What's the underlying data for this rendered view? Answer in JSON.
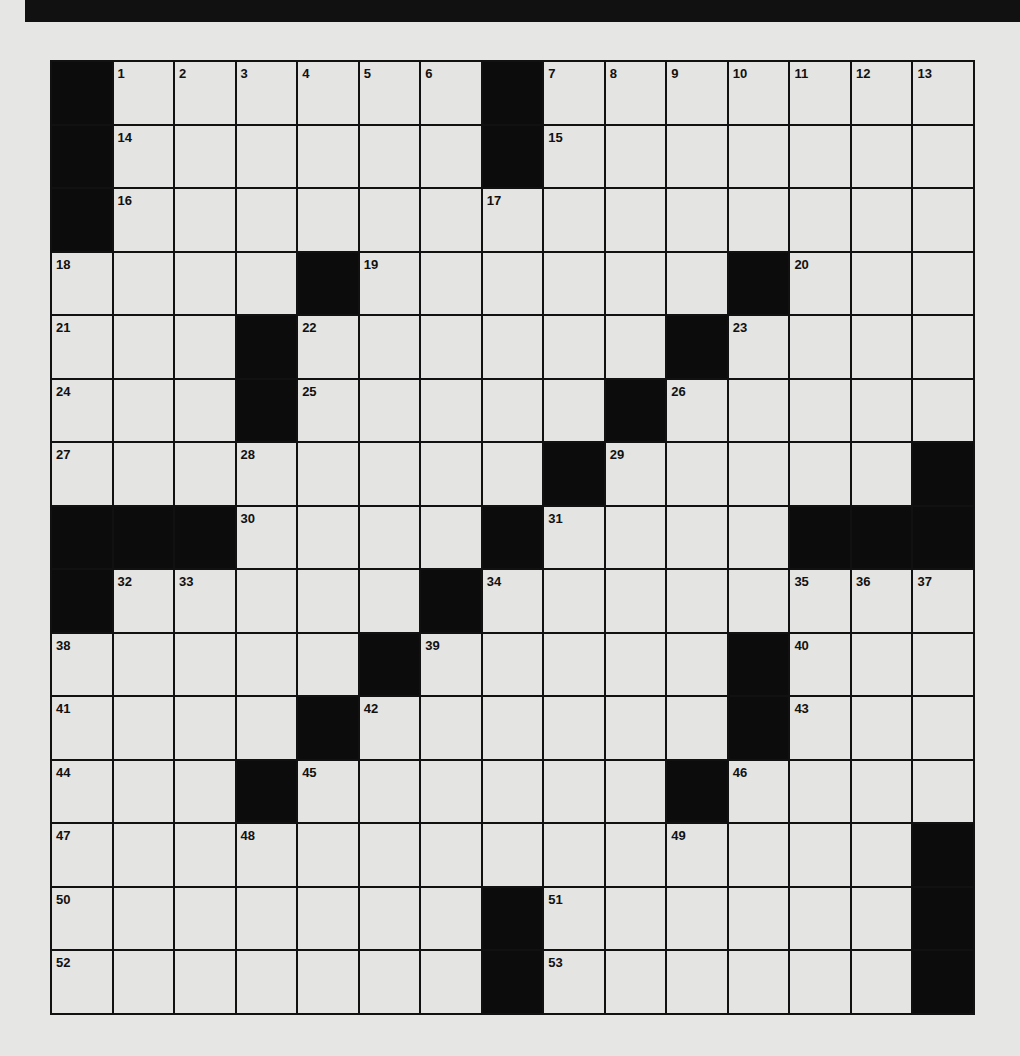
{
  "puzzle": {
    "rows": 15,
    "cols": 15,
    "colors": {
      "black": "#0c0c0c",
      "white": "#e4e4e2",
      "line": "#111111"
    },
    "grid": [
      [
        "#",
        "1",
        "2",
        "3",
        "4",
        "5",
        "6",
        "#",
        "7",
        "8",
        "9",
        "10",
        "11",
        "12",
        "13"
      ],
      [
        "#",
        "14",
        ".",
        ".",
        ".",
        ".",
        ".",
        "#",
        "15",
        ".",
        ".",
        ".",
        ".",
        ".",
        "."
      ],
      [
        "#",
        "16",
        ".",
        ".",
        ".",
        ".",
        ".",
        "17",
        ".",
        ".",
        ".",
        ".",
        ".",
        ".",
        "."
      ],
      [
        "18",
        ".",
        ".",
        ".",
        "#",
        "19",
        ".",
        ".",
        ".",
        ".",
        ".",
        "#",
        "20",
        ".",
        "."
      ],
      [
        "21",
        ".",
        ".",
        "#",
        "22",
        ".",
        ".",
        ".",
        ".",
        ".",
        "#",
        "23",
        ".",
        ".",
        "."
      ],
      [
        "24",
        ".",
        ".",
        "#",
        "25",
        ".",
        ".",
        ".",
        ".",
        "#",
        "26",
        ".",
        ".",
        ".",
        "."
      ],
      [
        "27",
        ".",
        ".",
        "28",
        ".",
        ".",
        ".",
        ".",
        "#",
        "29",
        ".",
        ".",
        ".",
        ".",
        "#"
      ],
      [
        "#",
        "#",
        "#",
        "30",
        ".",
        ".",
        ".",
        "#",
        "31",
        ".",
        ".",
        ".",
        "#",
        "#",
        "#"
      ],
      [
        "#",
        "32",
        "33",
        ".",
        ".",
        ".",
        "#",
        "34",
        ".",
        ".",
        ".",
        ".",
        "35",
        "36",
        "37"
      ],
      [
        "38",
        ".",
        ".",
        ".",
        ".",
        "#",
        "39",
        ".",
        ".",
        ".",
        ".",
        "#",
        "40",
        ".",
        "."
      ],
      [
        "41",
        ".",
        ".",
        ".",
        "#",
        "42",
        ".",
        ".",
        ".",
        ".",
        ".",
        "#",
        "43",
        ".",
        "."
      ],
      [
        "44",
        ".",
        ".",
        "#",
        "45",
        ".",
        ".",
        ".",
        ".",
        ".",
        "#",
        "46",
        ".",
        ".",
        "."
      ],
      [
        "47",
        ".",
        ".",
        "48",
        ".",
        ".",
        ".",
        ".",
        ".",
        ".",
        "49",
        ".",
        ".",
        ".",
        "#"
      ],
      [
        "50",
        ".",
        ".",
        ".",
        ".",
        ".",
        ".",
        "#",
        "51",
        ".",
        ".",
        ".",
        ".",
        ".",
        "#"
      ],
      [
        "52",
        ".",
        ".",
        ".",
        ".",
        ".",
        ".",
        "#",
        "53",
        ".",
        ".",
        ".",
        ".",
        ".",
        "#"
      ]
    ]
  }
}
